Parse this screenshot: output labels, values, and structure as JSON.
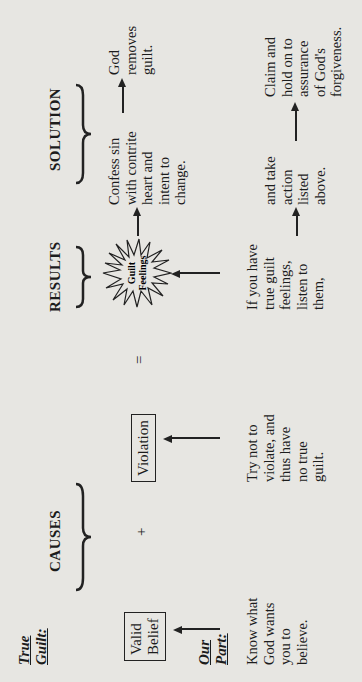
{
  "title": {
    "line1": "True",
    "line2": "Guilt:"
  },
  "our_part_label": {
    "line1": "Our",
    "line2": "Part:"
  },
  "headers": {
    "causes": "CAUSES",
    "results": "RESULTS",
    "solution": "SOLUTION"
  },
  "boxes": {
    "valid_belief": "Valid\nBelief",
    "violation": "Violation"
  },
  "operators": {
    "plus": "+",
    "equals": "="
  },
  "starburst": {
    "line1": "Guilt",
    "line2": "Feelings"
  },
  "solution_top": {
    "confess": "Confess sin\nwith contrite\nheart and\nintent to\nchange.",
    "god_removes": "God\nremoves\nguilt."
  },
  "our_part": {
    "know": "Know what\nGod wants\nyou to\nbelieve.",
    "try_not": "Try not to\nviolate, and\nthus have\nno true\nguilt.",
    "if_you_have": "If you have\ntrue guilt\nfeelings,\nlisten to\nthem,",
    "and_take": "and take\naction\nlisted\nabove.",
    "claim": "Claim and\nhold on to\nassurance\nof God's\nforgiveness."
  }
}
